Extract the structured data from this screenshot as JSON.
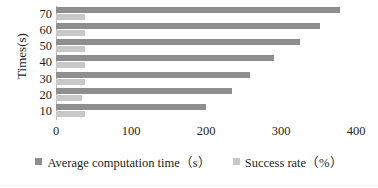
{
  "chart_data": {
    "type": "bar",
    "orientation": "horizontal",
    "title": "",
    "xlabel": "",
    "ylabel": "Times(s)",
    "categories": [
      "10",
      "20",
      "30",
      "40",
      "50",
      "60",
      "70"
    ],
    "x_ticks": [
      0,
      100,
      200,
      300,
      400
    ],
    "xlim": [
      0,
      400
    ],
    "grid": false,
    "legend_position": "bottom",
    "series": [
      {
        "name": "Average computation time（s）",
        "unit": "s",
        "color": "#8e8e8e",
        "values": [
          200,
          235,
          258,
          290,
          325,
          352,
          378
        ]
      },
      {
        "name": "Success rate（%）",
        "unit": "%",
        "color": "#c8c8c8",
        "values": [
          38,
          34,
          38,
          38,
          38,
          38,
          38
        ]
      }
    ]
  },
  "axes": {
    "y_title": "Times(s)",
    "y_tick_labels": [
      "70",
      "60",
      "50",
      "40",
      "30",
      "20",
      "10"
    ],
    "x_tick_labels": [
      "0",
      "100",
      "200",
      "300",
      "400"
    ]
  },
  "legend": {
    "items": [
      {
        "label": "Average computation time（s）",
        "swatch": "dark-gray-square"
      },
      {
        "label": "Success rate（%）",
        "swatch": "light-gray-square"
      }
    ]
  },
  "colors": {
    "series_dark": "#8e8e8e",
    "series_light": "#c8c8c8",
    "axis": "#bfbfbf",
    "text": "#231f20",
    "background": "#ffffff"
  }
}
